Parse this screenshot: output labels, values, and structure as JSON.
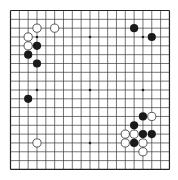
{
  "board": {
    "size": 19,
    "origin_x": 10.5,
    "origin_y": 10.5,
    "spacing": 8.83,
    "stone_radius": 4.1,
    "colors": {
      "background": "#ffffff",
      "line": "#3a3a3a",
      "border": "#222222",
      "black_stone": "#1a1a1a",
      "white_stone": "#ffffff",
      "white_stone_outline": "#333333",
      "star_point": "#222222"
    },
    "star_points": [
      [
        3,
        3
      ],
      [
        9,
        3
      ],
      [
        15,
        3
      ],
      [
        3,
        9
      ],
      [
        9,
        9
      ],
      [
        15,
        9
      ],
      [
        3,
        15
      ],
      [
        9,
        15
      ],
      [
        15,
        15
      ]
    ],
    "stones": [
      {
        "color": "white",
        "col": 3,
        "row": 2
      },
      {
        "color": "white",
        "col": 5,
        "row": 2
      },
      {
        "color": "white",
        "col": 2,
        "row": 3
      },
      {
        "color": "white",
        "col": 2,
        "row": 4
      },
      {
        "color": "black",
        "col": 3,
        "row": 4
      },
      {
        "color": "black",
        "col": 2,
        "row": 5
      },
      {
        "color": "black",
        "col": 3,
        "row": 6
      },
      {
        "color": "black",
        "col": 14,
        "row": 2
      },
      {
        "color": "black",
        "col": 16,
        "row": 3
      },
      {
        "color": "black",
        "col": 2,
        "row": 10
      },
      {
        "color": "white",
        "col": 3,
        "row": 15
      },
      {
        "color": "black",
        "col": 15,
        "row": 12
      },
      {
        "color": "white",
        "col": 16,
        "row": 12
      },
      {
        "color": "black",
        "col": 14,
        "row": 13
      },
      {
        "color": "white",
        "col": 13,
        "row": 14
      },
      {
        "color": "white",
        "col": 14,
        "row": 14
      },
      {
        "color": "black",
        "col": 15,
        "row": 14
      },
      {
        "color": "black",
        "col": 16,
        "row": 14
      },
      {
        "color": "white",
        "col": 13,
        "row": 15
      },
      {
        "color": "black",
        "col": 14,
        "row": 15
      },
      {
        "color": "white",
        "col": 15,
        "row": 15
      },
      {
        "color": "white",
        "col": 15,
        "row": 16
      }
    ]
  }
}
